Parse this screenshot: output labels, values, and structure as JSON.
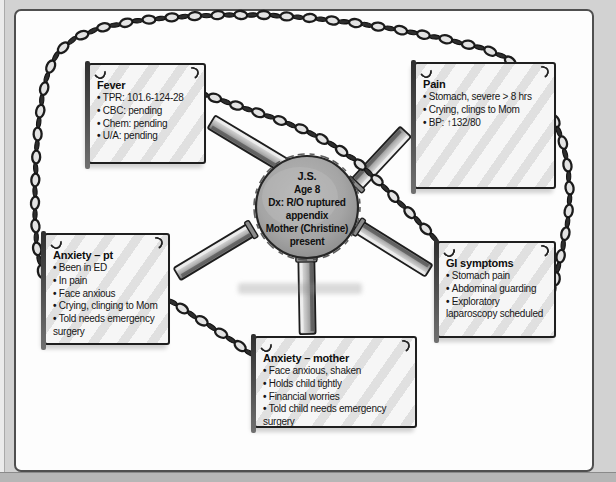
{
  "diagram": {
    "center": {
      "lines": [
        "J.S.",
        "Age 8",
        "Dx: R/O ruptured appendix",
        "Mother (Christine) present"
      ]
    },
    "boxes": [
      {
        "id": "fever",
        "title": "Fever",
        "bullets": [
          "TPR: 101.6-124-28",
          "CBC: pending",
          "Chem: pending",
          "U/A: pending"
        ]
      },
      {
        "id": "pain",
        "title": "Pain",
        "bullets": [
          "Stomach, severe > 8 hrs",
          "Crying, clings to Mom",
          "BP: ↑132/80"
        ]
      },
      {
        "id": "anxiety-pt",
        "title": "Anxiety – pt",
        "bullets": [
          "Been in ED",
          "In pain",
          "Face anxious",
          "Crying, clinging to Mom",
          "Told needs emergency surgery"
        ]
      },
      {
        "id": "gi-symptoms",
        "title": "GI symptoms",
        "bullets": [
          "Stomach pain",
          "Abdominal guarding",
          "Exploratory laparoscopy scheduled"
        ]
      },
      {
        "id": "anxiety-mother",
        "title": "Anxiety – mother",
        "bullets": [
          "Face anxious, shaken",
          "Holds child tightly",
          "Financial worries",
          "Told child needs emergency surgery"
        ]
      }
    ],
    "colors": {
      "page_bg": "#d2d2d2",
      "frame_bg": "#fdfdfd",
      "frame_border": "#4f4f4f",
      "ink": "#1a1a1a",
      "circle_fill": "#9c9c9c",
      "chain": "#2a2a2a"
    }
  }
}
